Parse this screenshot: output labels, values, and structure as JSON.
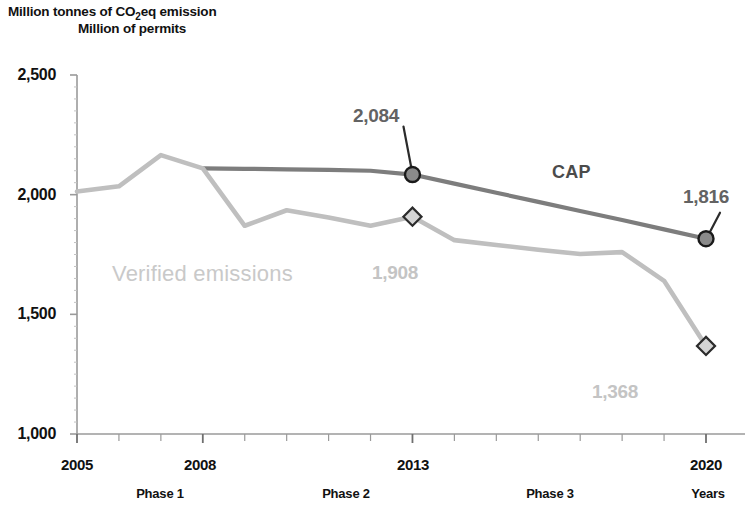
{
  "header": {
    "title_line_1_prefix": "Million tonnes of CO",
    "title_line_1_sub": "2",
    "title_line_1_suffix": "eq emission",
    "title_line_2": "Million of permits"
  },
  "axes": {
    "y_ticks": [
      "2,500",
      "2,000",
      "1,500",
      "1,000"
    ],
    "x_ticks": [
      "2005",
      "2008",
      "2013",
      "2020"
    ],
    "x_axis_caption": "Years"
  },
  "phases": [
    {
      "label": "Phase 1"
    },
    {
      "label": "Phase 2"
    },
    {
      "label": "Phase 3"
    }
  ],
  "series_labels": {
    "verified": "Verified emissions",
    "cap": "CAP"
  },
  "annotations": {
    "cap_2013": "2,084",
    "cap_2020": "1,816",
    "verified_2013": "1,908",
    "verified_2020": "1,368"
  },
  "colors": {
    "cap_line": "#7d7d7d",
    "verified_line": "#bfbfbf",
    "cap_marker_fill": "#8a8a8a",
    "cap_marker_stroke": "#1a1a1a",
    "verified_marker_fill": "#d4d4d4",
    "verified_marker_stroke": "#2b2b2b",
    "axis": "#9a9a9a",
    "text": "#111111"
  },
  "chart_data": {
    "type": "line",
    "xlabel": "Years",
    "ylabel": "Million tonnes of CO2eq emission / Million of permits",
    "xlim": [
      2005,
      2020
    ],
    "ylim": [
      1000,
      2500
    ],
    "ytick_values": [
      1000,
      1500,
      2000,
      2500
    ],
    "xtick_values": [
      2005,
      2008,
      2013,
      2020
    ],
    "grid": false,
    "legend": "inline-labels",
    "x": [
      2005,
      2006,
      2007,
      2008,
      2009,
      2010,
      2011,
      2012,
      2013,
      2014,
      2015,
      2016,
      2017,
      2018,
      2019,
      2020
    ],
    "series": [
      {
        "name": "CAP",
        "color": "#7d7d7d",
        "x": [
          2008,
          2009,
          2010,
          2011,
          2012,
          2013,
          2014,
          2015,
          2016,
          2017,
          2018,
          2019,
          2020
        ],
        "values": [
          2110,
          2108,
          2106,
          2104,
          2100,
          2084,
          2046,
          2008,
          1970,
          1932,
          1894,
          1855,
          1816
        ],
        "markers": [
          {
            "x": 2013,
            "y": 2084,
            "shape": "circle",
            "label": "2,084"
          },
          {
            "x": 2020,
            "y": 1816,
            "shape": "circle",
            "label": "1,816"
          }
        ]
      },
      {
        "name": "Verified emissions",
        "color": "#bfbfbf",
        "x": [
          2005,
          2006,
          2007,
          2008,
          2009,
          2010,
          2011,
          2012,
          2013,
          2014,
          2015,
          2016,
          2017,
          2018,
          2019,
          2020
        ],
        "values": [
          2013,
          2035,
          2165,
          2110,
          1870,
          1935,
          1905,
          1870,
          1908,
          1810,
          1790,
          1770,
          1752,
          1760,
          1640,
          1368
        ],
        "markers": [
          {
            "x": 2013,
            "y": 1908,
            "shape": "diamond",
            "label": "1,908"
          },
          {
            "x": 2020,
            "y": 1368,
            "shape": "diamond",
            "label": "1,368"
          }
        ]
      }
    ],
    "phase_bands": [
      {
        "label": "Phase 1",
        "start": 2005,
        "end": 2007
      },
      {
        "label": "Phase 2",
        "start": 2008,
        "end": 2012
      },
      {
        "label": "Phase 3",
        "start": 2013,
        "end": 2020
      }
    ]
  }
}
